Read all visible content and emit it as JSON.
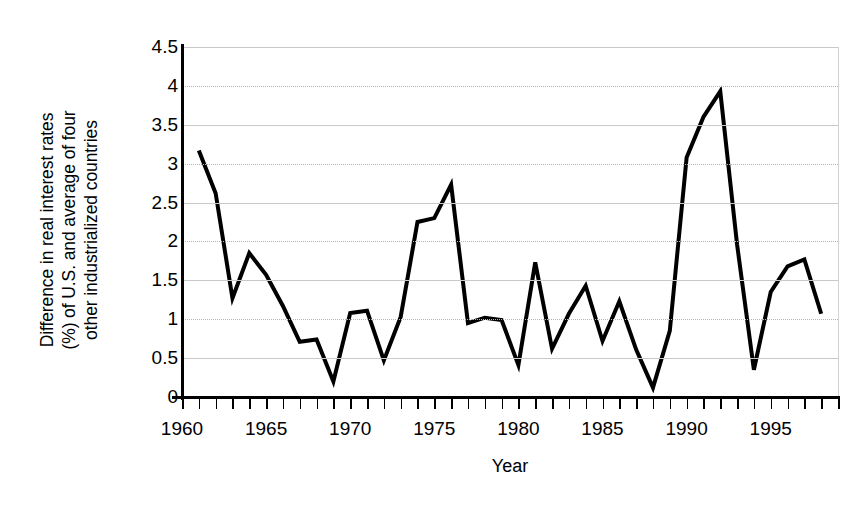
{
  "chart_data": {
    "type": "line",
    "title": "",
    "xlabel": "Year",
    "ylabel": "Difference in real interest rates\n(%) of U.S. and average of four\nother industrialized countries",
    "ylabel_lines": [
      "Difference in real interest rates",
      "(%) of U.S. and average of four",
      "other industrialized countries"
    ],
    "xlim": [
      1960,
      1999
    ],
    "ylim": [
      0,
      4.5
    ],
    "yticks": [
      0,
      0.5,
      1,
      1.5,
      2,
      2.5,
      3,
      3.5,
      4,
      4.5
    ],
    "ytick_labels": [
      "0",
      "0.5",
      "1",
      "1.5",
      "2",
      "2.5",
      "3",
      "3.5",
      "4",
      "4.5"
    ],
    "xticks": [
      1960,
      1965,
      1970,
      1975,
      1980,
      1985,
      1990,
      1995
    ],
    "xtick_labels": [
      "1960",
      "1965",
      "1970",
      "1975",
      "1980",
      "1985",
      "1990",
      "1995"
    ],
    "x_minor_tick_interval": 1,
    "grid": "horizontal",
    "grid_color": "#c9c9c9",
    "legend": "none",
    "line_color": "#000000",
    "line_width": 4,
    "background_color": "#ffffff",
    "x": [
      1961,
      1962,
      1963,
      1964,
      1965,
      1966,
      1967,
      1968,
      1969,
      1970,
      1971,
      1972,
      1973,
      1974,
      1975,
      1976,
      1977,
      1978,
      1979,
      1980,
      1981,
      1982,
      1983,
      1984,
      1985,
      1986,
      1987,
      1988,
      1989,
      1990,
      1991,
      1992,
      1993,
      1994,
      1995,
      1996,
      1997,
      1998
    ],
    "values": [
      3.17,
      2.62,
      1.27,
      1.85,
      1.57,
      1.17,
      0.71,
      0.74,
      0.2,
      1.08,
      1.11,
      0.47,
      1.03,
      2.25,
      2.3,
      2.73,
      0.95,
      1.02,
      0.99,
      0.41,
      1.73,
      0.62,
      1.07,
      1.43,
      0.72,
      1.23,
      0.61,
      0.12,
      0.85,
      3.08,
      3.6,
      3.93,
      1.96,
      0.35,
      1.35,
      1.68,
      1.77,
      1.07
    ],
    "series": [
      {
        "name": "Difference in real interest rates",
        "values": [
          3.17,
          2.62,
          1.27,
          1.85,
          1.57,
          1.17,
          0.71,
          0.74,
          0.2,
          1.08,
          1.11,
          0.47,
          1.03,
          2.25,
          2.3,
          2.73,
          0.95,
          1.02,
          0.99,
          0.41,
          1.73,
          0.62,
          1.07,
          1.43,
          0.72,
          1.23,
          0.61,
          0.12,
          0.85,
          3.08,
          3.6,
          3.93,
          1.96,
          0.35,
          1.35,
          1.68,
          1.77,
          1.07
        ]
      }
    ]
  }
}
